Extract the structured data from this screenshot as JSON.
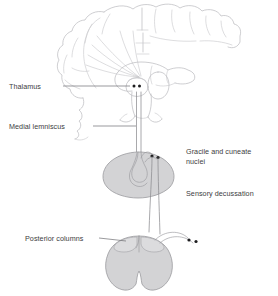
{
  "figure": {
    "background_color": "#ffffff",
    "canvas": {
      "width": 278,
      "height": 296
    }
  },
  "colors": {
    "brain_outline": "#b9b9bd",
    "gray_matter_fill": "#d3d3d5",
    "gray_matter_stroke": "#9a9a9e",
    "tract_line": "#8c8c90",
    "leader_line": "#6f6f73",
    "label_text": "#3c3c3e",
    "marker_dot": "#1d1d1f"
  },
  "labels": {
    "thalamus": {
      "text": "Thalamus",
      "side": "left",
      "x": 9,
      "y": 88
    },
    "medial_lemniscus": {
      "text": "Medial lemniscus",
      "side": "left",
      "x": 9,
      "y": 128
    },
    "gracile_and_cuneate_nuclei": {
      "text_line_1": "Gracile and cuneate",
      "text_line_2": "nuclei",
      "side": "right",
      "x": 186,
      "y": 155
    },
    "sensory_decussation": {
      "text": "Sensory decussation",
      "side": "right",
      "x": 186,
      "y": 196
    },
    "posterior_columns": {
      "text": "Posterior columns",
      "side": "left",
      "x": 25,
      "y": 240
    }
  },
  "structures": [
    {
      "name": "cerebrum",
      "kind": "outline",
      "description": "Coronal section of cerebral hemispheres with gyri"
    },
    {
      "name": "thalamus",
      "kind": "outline",
      "description": "Oval nucleus in diencephalon with two marker dots"
    },
    {
      "name": "corona-radiata",
      "kind": "fiber-fan",
      "description": "Fibers radiating from thalamus to cortex"
    },
    {
      "name": "brainstem-pons",
      "kind": "outline",
      "description": "Pons below thalamus"
    },
    {
      "name": "medulla-oblongata",
      "kind": "filled",
      "description": "Gray filled medulla cross-section with dorsal notch"
    },
    {
      "name": "spinal-cord",
      "kind": "filled",
      "description": "Gray filled spinal cord cross-section, butterfly shape"
    },
    {
      "name": "medial-lemniscus-tract",
      "kind": "tract",
      "description": "Paired ascending lines from medulla to thalamus"
    },
    {
      "name": "decussation-tract",
      "kind": "tract",
      "description": "Crossing fibers between medulla and spinal cord"
    },
    {
      "name": "dorsal-root-fibers",
      "kind": "tract",
      "description": "Two arcing fibers entering dorsal spinal cord from ganglia"
    }
  ],
  "markers": {
    "thalamus_dots": 2,
    "nuclei_dots": 2,
    "ganglion_dots": 2
  }
}
